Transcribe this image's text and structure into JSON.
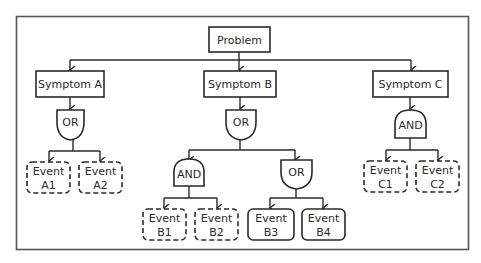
{
  "diagram": {
    "type": "fault-tree",
    "root": {
      "label": "Problem"
    },
    "symptoms": [
      {
        "label": "Symptom A",
        "gate": "OR"
      },
      {
        "label": "Symptom B",
        "gate": "OR"
      },
      {
        "label": "Symptom C",
        "gate": "AND"
      }
    ],
    "sub_gates": [
      {
        "parent": "Symptom B",
        "gate": "AND"
      },
      {
        "parent": "Symptom B",
        "gate": "OR"
      }
    ],
    "events": [
      {
        "line1": "Event",
        "line2": "A1",
        "style": "dashed"
      },
      {
        "line1": "Event",
        "line2": "A2",
        "style": "dashed"
      },
      {
        "line1": "Event",
        "line2": "B1",
        "style": "dashed"
      },
      {
        "line1": "Event",
        "line2": "B2",
        "style": "dashed"
      },
      {
        "line1": "Event",
        "line2": "B3",
        "style": "solid"
      },
      {
        "line1": "Event",
        "line2": "B4",
        "style": "solid"
      },
      {
        "line1": "Event",
        "line2": "C1",
        "style": "dashed"
      },
      {
        "line1": "Event",
        "line2": "C2",
        "style": "dashed"
      }
    ]
  },
  "colors": {
    "stroke": "#2a2a2a",
    "frame": "#555555",
    "background": "#ffffff"
  }
}
